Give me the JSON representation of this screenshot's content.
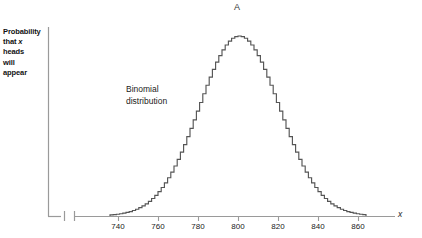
{
  "figure": {
    "panel_label": "A",
    "ylabel_lines": [
      "Probability",
      "that",
      "heads",
      "will",
      "appear"
    ],
    "ylabel_italic_var": "x",
    "ylabel_full": "Probability that x heads will appear",
    "curve_label_lines": [
      "Binomial",
      "distribution"
    ],
    "x_axis_name": "x"
  },
  "colors": {
    "background": "#ffffff",
    "curve": "#555555",
    "axis": "#9a9a9a",
    "text": "#1a1a1a"
  },
  "chart_data": {
    "type": "line",
    "title": "A",
    "xlabel": "x",
    "ylabel": "Probability that x heads will appear",
    "legend": [],
    "annotations": [
      "Binomial distribution"
    ],
    "grid": false,
    "axis_break": true,
    "axis_break_note": "x-axis is broken between the origin and the start of the numeric scale",
    "xlim": [
      730,
      868
    ],
    "ylim": [
      0,
      0.0212
    ],
    "xticks": [
      740,
      760,
      780,
      800,
      820,
      840,
      860
    ],
    "xtick_labels": [
      "740",
      "760",
      "780",
      "800",
      "820",
      "840",
      "860"
    ],
    "yticks": [],
    "ytick_labels": [],
    "distribution": {
      "name": "binomial",
      "n": 1600,
      "p": 0.5,
      "mean": 800,
      "sd": 20
    },
    "x": [
      736,
      740,
      744,
      748,
      752,
      756,
      760,
      764,
      768,
      772,
      776,
      780,
      784,
      788,
      792,
      796,
      800,
      804,
      808,
      812,
      816,
      820,
      824,
      828,
      832,
      836,
      840,
      844,
      848,
      852,
      856,
      860,
      864
    ],
    "values": [
      0.00044,
      0.00079,
      0.00133,
      0.00213,
      0.00324,
      0.00467,
      0.00639,
      0.00829,
      0.01021,
      0.01194,
      0.01324,
      0.01392,
      0.01392,
      0.01324,
      0.01194,
      0.01021,
      0.00829,
      0.00639,
      0.00467,
      0.00324,
      0.00213,
      0.00133,
      0.00079,
      0.00044,
      0.00023,
      0.00012,
      6e-05,
      3e-05,
      1e-05,
      4e-06,
      2e-06,
      1e-06,
      3e-07
    ],
    "series": [
      {
        "name": "Binomial distribution",
        "x": [
          740,
          745,
          750,
          755,
          760,
          765,
          770,
          775,
          780,
          785,
          790,
          795,
          800,
          805,
          810,
          815,
          820,
          825,
          830,
          835,
          840,
          845,
          850,
          855,
          860
        ],
        "values": [
          0.00079,
          0.00172,
          0.00335,
          0.00583,
          0.0091,
          0.01275,
          0.01599,
          0.01796,
          0.01809,
          0.01636,
          0.01327,
          0.00966,
          0.00631,
          0.0037,
          0.00194,
          0.00092,
          0.00039,
          0.00015,
          5e-05,
          1e-05,
          4e-06,
          1e-06,
          2e-07,
          5e-08,
          1e-08
        ]
      }
    ]
  },
  "geometry": {
    "plot_left_px": 48,
    "plot_right_px": 395,
    "baseline_y_px": 216,
    "y_axis_top_px": 27,
    "x_at_740_px": 118,
    "px_per_unit": 2,
    "peak_y_px": 36,
    "break_mark_x_px": [
      64,
      74
    ]
  }
}
